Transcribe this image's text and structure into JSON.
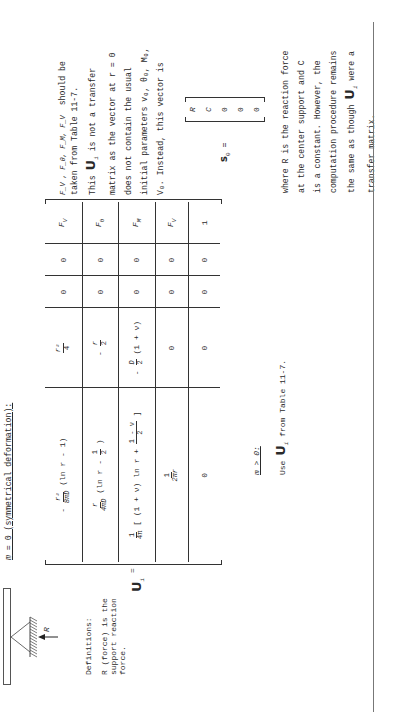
{
  "header": {
    "case_label": "m = 0 (symmetrical deformation):"
  },
  "figure": {
    "force_label": "R"
  },
  "definitions": {
    "title": "Definitions:",
    "line1": "R  (force) is the",
    "line2": "support reaction",
    "line3": "force."
  },
  "matrix": {
    "symbol": "U",
    "subscript": "i",
    "equals": "=",
    "rows": [
      {
        "c1": "- r²/(8πD) (ln r - 1)",
        "c1_num": "r²",
        "c1_den": "8πD",
        "c1_prefix": "-",
        "c1_tail": "(ln r - 1)",
        "c2_num": "r²",
        "c2_den": "4",
        "c2_prefix": "",
        "c3": "0",
        "c4": "0",
        "c5": "F_V",
        "c5_base": "F",
        "c5_sub": "V"
      },
      {
        "c1_num": "r",
        "c1_den": "4πD",
        "c1_tail_a": "(ln r -",
        "c1_tail_num": "1",
        "c1_tail_den": "2",
        "c1_tail_b": ")",
        "c2_num": "r",
        "c2_den": "2",
        "c2_prefix": "-",
        "c3": "0",
        "c4": "0",
        "c5_base": "F",
        "c5_sub": "θ"
      },
      {
        "c1_num": "1",
        "c1_den": "4π",
        "c1_tail_a": "[ (1 + ν) ln r +",
        "c1_tail_num": "1 - ν",
        "c1_tail_den": "2",
        "c1_tail_b": "]",
        "c2_num": "D",
        "c2_den": "2",
        "c2_prefix": "-",
        "c2_tail": "(1 + ν)",
        "c3": "0",
        "c4": "0",
        "c5_base": "F",
        "c5_sub": "M"
      },
      {
        "c1_num": "1",
        "c1_den": "2πr",
        "c2": "0",
        "c3": "0",
        "c4": "0",
        "c5_base": "F",
        "c5_sub": "V"
      },
      {
        "c1": "0",
        "c2": "0",
        "c3": "0",
        "c4": "0",
        "c5": "1"
      }
    ]
  },
  "case2": {
    "label": "m > 0:",
    "text_pre": "Use",
    "symbol": "U",
    "subscript": "i",
    "text_post": "from Table 11-7."
  },
  "right_column": {
    "p1": {
      "line1_vars": "F_V , F_θ, F_M, F_V",
      "line1_tail": "should be",
      "line2": "taken from Table 11-7.",
      "line3_pre": "This",
      "line3_post": "is not a transfer",
      "line4": "matrix as the vector at r = 0",
      "line5": "does not contain the usual",
      "line6": "initial parameters v₀, θ₀, M₀,",
      "line7": "V₀.  Instead, this vector is"
    },
    "vector": {
      "symbol": "s",
      "subscript": "0",
      "equals": "=",
      "entries": [
        "R",
        "C",
        "0",
        "0",
        "0"
      ]
    },
    "p2": {
      "line1": "where R is the reaction force",
      "line2": "at the center support and C",
      "line3": "is a constant.  However, the",
      "line4": "computation procedure remains",
      "line5_pre": "the same as though",
      "line5_post": "were a",
      "line6": "transfer matrix."
    }
  }
}
